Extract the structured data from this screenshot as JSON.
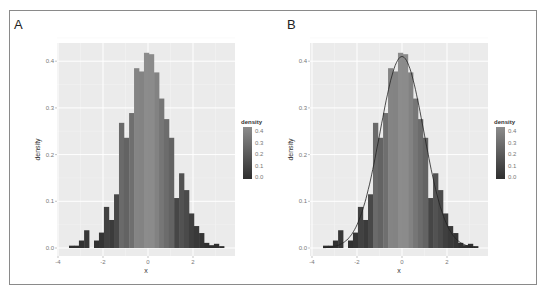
{
  "figure": {
    "panels": [
      "A",
      "B"
    ]
  },
  "chart_data": [
    {
      "panel": "A",
      "type": "bar",
      "title": "",
      "xlabel": "x",
      "ylabel": "density",
      "xlim": [
        -4,
        3.5
      ],
      "ylim": [
        0,
        0.44
      ],
      "x_ticks": [
        "-4",
        "-2",
        "0",
        "2"
      ],
      "y_ticks": [
        "0.0",
        "0.1",
        "0.2",
        "0.3",
        "0.4"
      ],
      "grid": true,
      "legend": {
        "title": "density",
        "type": "colorbar",
        "labels": [
          "0.4",
          "0.3",
          "0.2",
          "0.1",
          "0.0"
        ],
        "position": "right"
      },
      "bin_width": 0.222,
      "bin_left_edges": [
        -3.51,
        -3.29,
        -3.07,
        -2.84,
        -2.62,
        -2.4,
        -2.18,
        -1.96,
        -1.73,
        -1.51,
        -1.29,
        -1.07,
        -0.84,
        -0.62,
        -0.4,
        -0.18,
        0.04,
        0.27,
        0.49,
        0.71,
        0.93,
        1.16,
        1.38,
        1.6,
        1.82,
        2.04,
        2.27,
        2.49,
        2.71,
        2.93,
        3.16
      ],
      "values": [
        0.005,
        0.005,
        0.016,
        0.038,
        0.0,
        0.016,
        0.033,
        0.088,
        0.06,
        0.115,
        0.268,
        0.236,
        0.289,
        0.385,
        0.378,
        0.418,
        0.415,
        0.376,
        0.32,
        0.276,
        0.236,
        0.107,
        0.16,
        0.124,
        0.074,
        0.047,
        0.032,
        0.011,
        0.006,
        0.009,
        0.004
      ]
    },
    {
      "panel": "B",
      "type": "bar",
      "title": "",
      "xlabel": "x",
      "ylabel": "density",
      "xlim": [
        -4,
        3.5
      ],
      "ylim": [
        0,
        0.44
      ],
      "x_ticks": [
        "-4",
        "-2",
        "0",
        "2"
      ],
      "y_ticks": [
        "0.0",
        "0.1",
        "0.2",
        "0.3",
        "0.4"
      ],
      "grid": true,
      "legend": {
        "title": "density",
        "type": "colorbar",
        "labels": [
          "0.4",
          "0.3",
          "0.2",
          "0.1",
          "0.0"
        ],
        "position": "right"
      },
      "bin_width": 0.222,
      "bin_left_edges": [
        -3.51,
        -3.29,
        -3.07,
        -2.84,
        -2.62,
        -2.4,
        -2.18,
        -1.96,
        -1.73,
        -1.51,
        -1.29,
        -1.07,
        -0.84,
        -0.62,
        -0.4,
        -0.18,
        0.04,
        0.27,
        0.49,
        0.71,
        0.93,
        1.16,
        1.38,
        1.6,
        1.82,
        2.04,
        2.27,
        2.49,
        2.71,
        2.93,
        3.16
      ],
      "values": [
        0.005,
        0.005,
        0.016,
        0.038,
        0.0,
        0.016,
        0.033,
        0.088,
        0.06,
        0.115,
        0.268,
        0.236,
        0.289,
        0.385,
        0.378,
        0.418,
        0.415,
        0.376,
        0.32,
        0.276,
        0.236,
        0.107,
        0.16,
        0.124,
        0.074,
        0.047,
        0.032,
        0.011,
        0.006,
        0.009,
        0.004
      ],
      "overlay": {
        "type": "line",
        "name": "density curve",
        "peak": 0.41,
        "peak_x": 0.0
      }
    }
  ],
  "colors": {
    "panel_bg": "#ebebeb",
    "grid": "#ffffff",
    "low": "#2e2e2e",
    "high": "#8c8c8c",
    "curve": "#222222"
  }
}
